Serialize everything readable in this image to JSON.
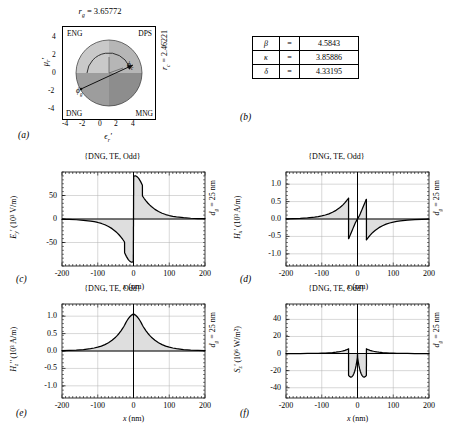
{
  "figure": {
    "panels": [
      "(a)",
      "(b)",
      "(c)",
      "(d)",
      "(e)",
      "(f)"
    ]
  },
  "panel_a": {
    "label": "(a)",
    "top_annotation_sym": "r",
    "top_annotation_sub": "g",
    "top_annotation_value": "= 3.65772",
    "right_annotation_sym": "r",
    "right_annotation_sub": "c",
    "right_annotation_value": "= 2.46221",
    "xlabel_sym": "ϵ",
    "xlabel_sub": "r",
    "xlabel_prime": "'",
    "ylabel_sym": "μ",
    "ylabel_sub": "r",
    "ylabel_prime": "'",
    "quadrants": [
      "ENG",
      "DPS",
      "DNG",
      "MNG"
    ],
    "angle_labels": [
      "ϕ",
      "ϕ"
    ],
    "angle_subs": [
      "c",
      "g"
    ],
    "xticks": [
      "-4",
      "-2",
      "0",
      "2",
      "4"
    ],
    "yticks": [
      "4",
      "2",
      "0",
      "-2",
      "-4"
    ],
    "xlim": [
      -5,
      5
    ],
    "ylim": [
      -5,
      5
    ],
    "circle_radius": 3.6,
    "quadrant_colors": {
      "eng": "#c8c8c8",
      "dps": "#b4b4b4",
      "dng": "#9a9a9a",
      "mng": "#8a8a8a"
    }
  },
  "panel_b": {
    "label": "(b)",
    "rows": [
      {
        "symbol": "β",
        "eq": "=",
        "value": "4.5843"
      },
      {
        "symbol": "κ",
        "eq": "=",
        "value": "3.85886"
      },
      {
        "symbol": "δ",
        "eq": "=",
        "value": "4.33195"
      }
    ]
  },
  "chart_data": [
    {
      "panel": "(c)",
      "type": "line",
      "title": "{DNG, TE, Odd}",
      "xlabel": "x (nm)",
      "ylabel_sym": "E",
      "ylabel_sub": "y",
      "ylabel_prime": "'",
      "ylabel_units": "(10³ V/m)",
      "right_label_sym": "d",
      "right_label_sub": "g",
      "right_label_value": "= 25 nm",
      "xlim": [
        -200,
        200
      ],
      "ylim": [
        -100,
        100
      ],
      "xticks": [
        -200,
        -100,
        0,
        100,
        200
      ],
      "xticklabels": [
        "-200",
        "-100",
        "0",
        "100",
        "200"
      ],
      "yticks": [
        -50,
        0,
        50
      ],
      "yticklabels": [
        "-50",
        "0",
        "50"
      ],
      "grid": true,
      "fill": true,
      "x": [
        -200,
        -180,
        -160,
        -140,
        -120,
        -110,
        -100,
        -90,
        -80,
        -70,
        -60,
        -50,
        -45,
        -40,
        -35,
        -30,
        -27,
        -25,
        -24.9,
        -20,
        -15,
        -12,
        -10,
        -8,
        -6,
        -4,
        -2,
        -0.5,
        0,
        0.5,
        2,
        4,
        6,
        8,
        10,
        12,
        15,
        20,
        24.9,
        25,
        27,
        30,
        35,
        40,
        45,
        50,
        60,
        70,
        80,
        90,
        100,
        110,
        120,
        140,
        160,
        180,
        200
      ],
      "y": [
        -0.6,
        -1.0,
        -1.6,
        -2.7,
        -4.4,
        -5.7,
        -7.4,
        -9.5,
        -12.3,
        -15.9,
        -20.5,
        -26.5,
        -30.0,
        -34.0,
        -38.6,
        -43.6,
        -46.8,
        -49.0,
        -72.0,
        -79.5,
        -86.0,
        -88.5,
        -90.0,
        -91.0,
        -91.6,
        -91.8,
        -91.5,
        -90.5,
        0,
        90.5,
        91.5,
        91.8,
        91.6,
        91.0,
        90.0,
        88.5,
        86.0,
        79.5,
        72.0,
        49.0,
        46.8,
        43.6,
        38.6,
        34.0,
        30.0,
        26.5,
        20.5,
        15.9,
        12.3,
        9.5,
        7.4,
        5.7,
        4.4,
        2.7,
        1.6,
        1.0,
        0.6
      ]
    },
    {
      "panel": "(d)",
      "type": "line",
      "title": "{DNG, TE, Odd}",
      "xlabel": "x (nm)",
      "ylabel_sym": "H",
      "ylabel_sub": "x",
      "ylabel_prime": "'",
      "ylabel_units": "(10³ A/m)",
      "right_label_sym": "d",
      "right_label_sub": "g",
      "right_label_value": "= 25 nm",
      "xlim": [
        -200,
        200
      ],
      "ylim": [
        -1.35,
        1.35
      ],
      "xticks": [
        -200,
        -100,
        0,
        100,
        200
      ],
      "xticklabels": [
        "-200",
        "-100",
        "0",
        "100",
        "200"
      ],
      "yticks": [
        -1.0,
        -0.5,
        0,
        0.5,
        1.0
      ],
      "yticklabels": [
        "-1.0",
        "-0.5",
        "0.0",
        "0.5",
        "1.0"
      ],
      "grid": true,
      "fill": true,
      "x": [
        -200,
        -180,
        -160,
        -140,
        -120,
        -110,
        -100,
        -90,
        -80,
        -70,
        -60,
        -50,
        -45,
        -40,
        -35,
        -30,
        -27,
        -25,
        -24.9,
        -20,
        -15,
        -12,
        -10,
        -8,
        -6,
        -4,
        -2,
        -0.5,
        0,
        0.5,
        2,
        4,
        6,
        8,
        10,
        12,
        15,
        20,
        24.9,
        25,
        27,
        30,
        35,
        40,
        45,
        50,
        60,
        70,
        80,
        90,
        100,
        110,
        120,
        140,
        160,
        180,
        200
      ],
      "y": [
        0.007,
        0.012,
        0.02,
        0.033,
        0.054,
        0.069,
        0.089,
        0.115,
        0.149,
        0.193,
        0.249,
        0.322,
        0.365,
        0.414,
        0.47,
        0.532,
        0.572,
        0.6,
        -0.565,
        -0.455,
        -0.33,
        -0.255,
        -0.205,
        -0.155,
        -0.11,
        -0.07,
        -0.032,
        -0.008,
        0,
        0.008,
        0.032,
        0.07,
        0.11,
        0.155,
        0.205,
        0.255,
        0.33,
        0.455,
        0.565,
        -0.6,
        -0.572,
        -0.532,
        -0.47,
        -0.414,
        -0.365,
        -0.322,
        -0.249,
        -0.193,
        -0.149,
        -0.115,
        -0.089,
        -0.069,
        -0.054,
        -0.033,
        -0.02,
        -0.012,
        -0.007
      ]
    },
    {
      "panel": "(e)",
      "type": "line",
      "title": "{DNG, TE, Odd}",
      "xlabel": "x (nm)",
      "ylabel_sym": "H",
      "ylabel_sub": "z",
      "ylabel_prime": "''",
      "ylabel_units": "(10³ A/m)",
      "right_label_sym": "d",
      "right_label_sub": "g",
      "right_label_value": "= 25 nm",
      "xlim": [
        -200,
        200
      ],
      "ylim": [
        -1.35,
        1.35
      ],
      "xticks": [
        -200,
        -100,
        0,
        100,
        200
      ],
      "xticklabels": [
        "-200",
        "-100",
        "0",
        "100",
        "200"
      ],
      "yticks": [
        -1.0,
        -0.5,
        0,
        0.5,
        1.0
      ],
      "yticklabels": [
        "-1.0",
        "-0.5",
        "0.0",
        "0.5",
        "1.0"
      ],
      "grid": true,
      "fill": true,
      "x": [
        -200,
        -180,
        -160,
        -140,
        -120,
        -110,
        -100,
        -90,
        -80,
        -70,
        -60,
        -50,
        -45,
        -40,
        -35,
        -30,
        -27,
        -25,
        -22,
        -20,
        -17,
        -14,
        -11,
        -8,
        -6,
        -4,
        -2,
        0,
        2,
        4,
        6,
        8,
        11,
        14,
        17,
        20,
        22,
        25,
        27,
        30,
        35,
        40,
        45,
        50,
        60,
        70,
        80,
        90,
        100,
        110,
        120,
        140,
        160,
        180,
        200
      ],
      "y": [
        0.009,
        0.015,
        0.025,
        0.041,
        0.067,
        0.086,
        0.11,
        0.142,
        0.184,
        0.238,
        0.307,
        0.397,
        0.45,
        0.51,
        0.58,
        0.656,
        0.705,
        0.74,
        0.8,
        0.84,
        0.89,
        0.935,
        0.975,
        1.005,
        1.025,
        1.043,
        1.055,
        1.02,
        1.055,
        1.043,
        1.025,
        1.005,
        0.975,
        0.935,
        0.89,
        0.84,
        0.8,
        0.74,
        0.705,
        0.656,
        0.58,
        0.51,
        0.45,
        0.397,
        0.307,
        0.238,
        0.184,
        0.142,
        0.11,
        0.086,
        0.067,
        0.041,
        0.025,
        0.015,
        0.009
      ]
    },
    {
      "panel": "(f)",
      "type": "line",
      "title": "{DNG, TE, Odd}",
      "xlabel": "x (nm)",
      "ylabel_sym": "S",
      "ylabel_sub": "z",
      "ylabel_prime": "'",
      "ylabel_units": "(10⁶ W/m²)",
      "right_label_sym": "d",
      "right_label_sub": "g",
      "right_label_value": "= 25 nm",
      "xlim": [
        -200,
        200
      ],
      "ylim": [
        -52,
        58
      ],
      "xticks": [
        -200,
        -100,
        0,
        100,
        200
      ],
      "xticklabels": [
        "-200",
        "-100",
        "0",
        "100",
        "200"
      ],
      "yticks": [
        -40,
        -20,
        0,
        20,
        40
      ],
      "yticklabels": [
        "-40",
        "-20",
        "0",
        "20",
        "40"
      ],
      "grid": true,
      "fill": true,
      "x": [
        -200,
        -180,
        -160,
        -140,
        -120,
        -110,
        -100,
        -90,
        -80,
        -70,
        -60,
        -55,
        -50,
        -45,
        -40,
        -35,
        -30,
        -28,
        -26,
        -25,
        -24.9,
        -22,
        -19,
        -16,
        -13,
        -11,
        -10,
        -8,
        -6,
        -4,
        -2,
        -0.5,
        0,
        0.5,
        2,
        4,
        6,
        8,
        10,
        11,
        13,
        16,
        19,
        22,
        24.9,
        25,
        26,
        28,
        30,
        35,
        40,
        45,
        50,
        55,
        60,
        70,
        80,
        90,
        100,
        110,
        120,
        140,
        160,
        180,
        200
      ],
      "y": [
        0.02,
        0.04,
        0.07,
        0.13,
        0.24,
        0.33,
        0.45,
        0.62,
        0.86,
        1.18,
        1.64,
        1.93,
        2.28,
        2.7,
        3.21,
        3.83,
        4.58,
        4.95,
        5.35,
        5.56,
        -25.5,
        -26.9,
        -27.6,
        -27.2,
        -25.8,
        -24.3,
        -23.4,
        -21.0,
        -18.0,
        -14.2,
        -9.3,
        -5.0,
        0,
        -5.0,
        -9.3,
        -14.2,
        -18.0,
        -21.0,
        -23.4,
        -24.3,
        -25.8,
        -27.2,
        -27.6,
        -26.9,
        -25.5,
        5.56,
        5.35,
        4.95,
        4.58,
        3.83,
        3.21,
        2.7,
        2.28,
        1.93,
        1.64,
        1.18,
        0.86,
        0.62,
        0.45,
        0.33,
        0.24,
        0.13,
        0.07,
        0.04,
        0.02
      ]
    }
  ]
}
